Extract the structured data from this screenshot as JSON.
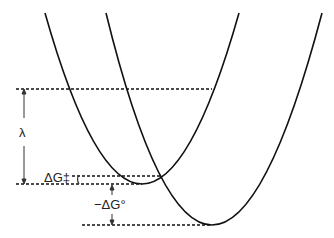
{
  "diagram": {
    "type": "marcus-parabolas",
    "labels": {
      "lambda": "λ",
      "activation": "ΔG‡",
      "driving_force": "−ΔG°"
    },
    "curves": [
      {
        "name": "reactant-parabola",
        "minimum": [
          142,
          184
        ]
      },
      {
        "name": "product-parabola",
        "minimum": [
          210,
          225
        ]
      }
    ],
    "colors": {
      "line": "#111111",
      "background": "#ffffff"
    }
  }
}
